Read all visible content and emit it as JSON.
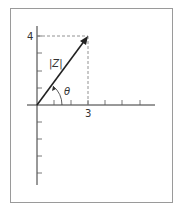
{
  "diagram": {
    "vector_label": "|Z|",
    "angle_label": "θ",
    "x_tick_label": "3",
    "y_tick_label": "4",
    "point": {
      "x": 3,
      "y": 4
    },
    "x_ticks": 6,
    "y_ticks_positive": 4,
    "y_ticks_negative": 4,
    "colors": {
      "axis": "#333333",
      "vector": "#222222",
      "dashed": "#777777",
      "frame": "#9a9a9a"
    }
  }
}
